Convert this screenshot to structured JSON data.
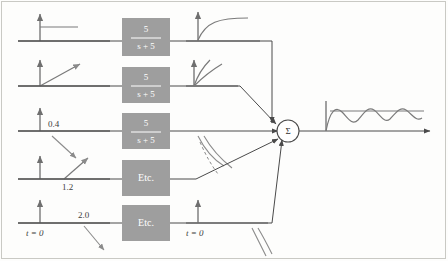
{
  "figure": {
    "colors": {
      "block_fill": "#9e9e9e",
      "block_text": "#ffffff",
      "axis": "#6f6f6f",
      "wire": "#4a4a4a",
      "signal": "#7a7a7a",
      "frame": "#c9c9c4",
      "background": "#fdfdfc"
    }
  },
  "blocks": [
    {
      "id": "block-row-1",
      "numerator": "5",
      "denominator": "s + 5",
      "kind": "fraction",
      "label": ""
    },
    {
      "id": "block-row-2",
      "numerator": "5",
      "denominator": "s + 5",
      "kind": "fraction",
      "label": ""
    },
    {
      "id": "block-row-3",
      "numerator": "5",
      "denominator": "s + 5",
      "kind": "fraction",
      "label": ""
    },
    {
      "id": "block-row-4",
      "numerator": "",
      "denominator": "",
      "kind": "text",
      "label": "Etc."
    },
    {
      "id": "block-row-5",
      "numerator": "",
      "denominator": "",
      "kind": "text",
      "label": "Etc."
    }
  ],
  "input_labels": [
    {
      "id": "input-amplitude-row-3",
      "text": "0.4"
    },
    {
      "id": "input-amplitude-row-4",
      "text": "1.2"
    },
    {
      "id": "input-amplitude-row-5",
      "text": "2.0"
    },
    {
      "id": "input-time-origin-row-5",
      "text": "t = 0"
    }
  ],
  "output_labels": [
    {
      "id": "output-time-origin-row-5",
      "text": "t = 0"
    }
  ],
  "summing_junction": {
    "symbol": "Σ",
    "input_count": 5,
    "output_count": 1
  },
  "rows": [
    {
      "id": "row-1",
      "input_shape": "step",
      "output_shape": "exponential-rise"
    },
    {
      "id": "row-2",
      "input_shape": "ramp",
      "output_shape": "rising-curves"
    },
    {
      "id": "row-3",
      "input_shape": "step",
      "output_shape": "decaying-curves"
    },
    {
      "id": "row-4",
      "input_shape": "ramp",
      "output_shape": "decaying-curves"
    },
    {
      "id": "row-5",
      "input_shape": "step",
      "output_shape": "decaying-curves"
    }
  ],
  "final_output": {
    "id": "final-output-plot",
    "shape": "damped-oscillation"
  }
}
